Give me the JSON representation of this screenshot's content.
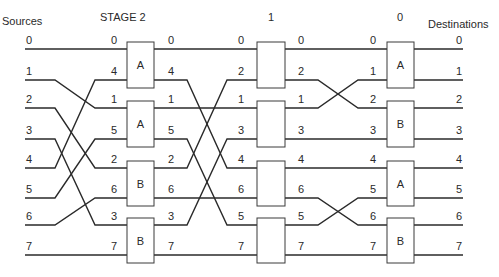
{
  "headers": {
    "sources": "Sources",
    "stage2": "STAGE 2",
    "stage1": "1",
    "stage0": "0",
    "destinations": "Destinations"
  },
  "rows_y": [
    49,
    80,
    108,
    139,
    168,
    198,
    225,
    255
  ],
  "sources": [
    "0",
    "1",
    "2",
    "3",
    "4",
    "5",
    "6",
    "7"
  ],
  "stage2": {
    "inputs": [
      "0",
      "4",
      "1",
      "5",
      "2",
      "6",
      "3",
      "7"
    ],
    "outputs": [
      "0",
      "4",
      "1",
      "5",
      "2",
      "6",
      "3",
      "7"
    ],
    "boxes": [
      "A",
      "A",
      "B",
      "B"
    ]
  },
  "stage1": {
    "inputs": [
      "0",
      "2",
      "1",
      "3",
      "4",
      "6",
      "5",
      "7"
    ],
    "outputs": [
      "0",
      "2",
      "1",
      "3",
      "4",
      "6",
      "5",
      "7"
    ],
    "boxes": [
      "",
      "",
      "",
      ""
    ]
  },
  "stage0": {
    "inputs": [
      "0",
      "1",
      "2",
      "3",
      "4",
      "5",
      "6",
      "7"
    ],
    "boxes": [
      "A",
      "B",
      "A",
      "B"
    ]
  },
  "destinations": [
    "0",
    "1",
    "2",
    "3",
    "4",
    "5",
    "6",
    "7"
  ],
  "permutations": {
    "sources_to_stage2": [
      [
        0,
        0
      ],
      [
        1,
        2
      ],
      [
        2,
        4
      ],
      [
        3,
        6
      ],
      [
        4,
        1
      ],
      [
        5,
        3
      ],
      [
        6,
        5
      ],
      [
        7,
        7
      ]
    ],
    "stage2_to_stage1": [
      [
        0,
        0
      ],
      [
        1,
        4
      ],
      [
        2,
        2
      ],
      [
        3,
        6
      ],
      [
        4,
        1
      ],
      [
        5,
        5
      ],
      [
        6,
        3
      ],
      [
        7,
        7
      ]
    ],
    "stage1_to_stage0": [
      [
        0,
        0
      ],
      [
        1,
        2
      ],
      [
        2,
        1
      ],
      [
        3,
        3
      ],
      [
        4,
        4
      ],
      [
        5,
        6
      ],
      [
        6,
        5
      ],
      [
        7,
        7
      ]
    ]
  }
}
